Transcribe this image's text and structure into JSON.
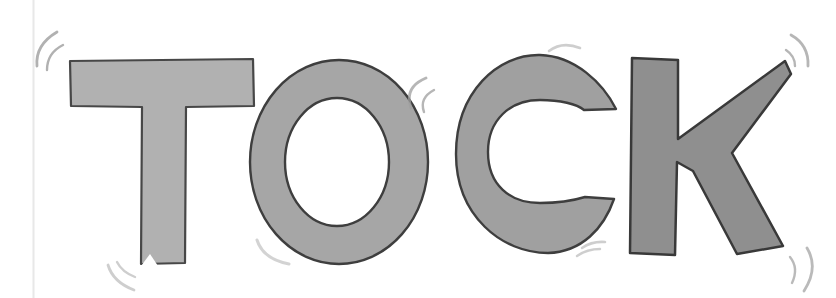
{
  "illustration": {
    "word": "TOCK",
    "alt": "The word TOCK hand-lettered in thick gray marker capital letters with small gray vibration strokes around the letters on white paper",
    "background_color": "#ffffff",
    "paper_edge_line_color": "#e8e8e8"
  },
  "letters": [
    {
      "char": "T",
      "fill": "#b1b1b1",
      "outline": "#474747"
    },
    {
      "char": "O",
      "fill": "#a6a6a6",
      "outline": "#3e3e3e"
    },
    {
      "char": "C",
      "fill": "#a0a0a0",
      "outline": "#3e3e3e"
    },
    {
      "char": "K",
      "fill": "#8f8f8f",
      "outline": "#393939"
    }
  ],
  "vibration_marks": {
    "color": "#9e9e9e",
    "positions": [
      "t-top-left",
      "t-bottom-left",
      "o-top-right",
      "o-bottom-left",
      "c-top-right",
      "c-bottom-left",
      "k-top-right",
      "k-bottom-right"
    ]
  }
}
